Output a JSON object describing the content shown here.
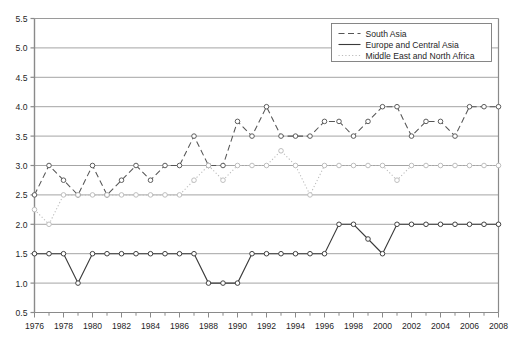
{
  "chart_data": {
    "type": "line",
    "title": "",
    "xlabel": "",
    "ylabel": "",
    "xlim": [
      1976,
      2008
    ],
    "ylim": [
      0.5,
      5.5
    ],
    "grid": true,
    "legend_position": "top-right",
    "xticks": [
      1976,
      1978,
      1980,
      1982,
      1984,
      1986,
      1988,
      1990,
      1992,
      1994,
      1996,
      1998,
      2000,
      2002,
      2004,
      2006,
      2008
    ],
    "xticklabels": [
      "1976",
      "1978",
      "1980",
      "1982",
      "1984",
      "1986",
      "1988",
      "1990",
      "1992",
      "1994",
      "1996",
      "1998",
      "2000",
      "2002",
      "2004",
      "2006",
      "2008"
    ],
    "yticks": [
      0.5,
      1.0,
      1.5,
      2.0,
      2.5,
      3.0,
      3.5,
      4.0,
      4.5,
      5.0,
      5.5
    ],
    "yticklabels": [
      "0.5",
      "1.0",
      "1.5",
      "2.0",
      "2.5",
      "3.0",
      "3.5",
      "4.0",
      "4.5",
      "5.0",
      "5.5"
    ],
    "x": [
      1976,
      1977,
      1978,
      1979,
      1980,
      1981,
      1982,
      1983,
      1984,
      1985,
      1986,
      1987,
      1988,
      1989,
      1990,
      1991,
      1992,
      1993,
      1994,
      1995,
      1996,
      1997,
      1998,
      1999,
      2000,
      2001,
      2002,
      2003,
      2004,
      2005,
      2006,
      2007,
      2008
    ],
    "series": [
      {
        "name": "South Asia",
        "style": "dashed",
        "marker": "circle",
        "color": "#555555",
        "values": [
          2.5,
          3.0,
          2.75,
          2.5,
          3.0,
          2.5,
          2.75,
          3.0,
          2.75,
          3.0,
          3.0,
          3.5,
          3.0,
          3.0,
          3.75,
          3.5,
          4.0,
          3.5,
          3.5,
          3.5,
          3.75,
          3.75,
          3.5,
          3.75,
          4.0,
          4.0,
          3.5,
          3.75,
          3.75,
          3.5,
          4.0,
          4.0,
          4.0
        ]
      },
      {
        "name": "Europe and Central Asia",
        "style": "solid",
        "marker": "circle",
        "color": "#3a3a3a",
        "values": [
          1.5,
          1.5,
          1.5,
          1.0,
          1.5,
          1.5,
          1.5,
          1.5,
          1.5,
          1.5,
          1.5,
          1.5,
          1.0,
          1.0,
          1.0,
          1.5,
          1.5,
          1.5,
          1.5,
          1.5,
          1.5,
          2.0,
          2.0,
          1.75,
          1.5,
          2.0,
          2.0,
          2.0,
          2.0,
          2.0,
          2.0,
          2.0,
          2.0
        ]
      },
      {
        "name": "Middle East and North Africa",
        "style": "dotted",
        "marker": "circle",
        "color": "#bbbbbb",
        "values": [
          2.25,
          2.0,
          2.5,
          2.5,
          2.5,
          2.5,
          2.5,
          2.5,
          2.5,
          2.5,
          2.5,
          2.75,
          3.0,
          2.75,
          3.0,
          3.0,
          3.0,
          3.25,
          3.0,
          2.5,
          3.0,
          3.0,
          3.0,
          3.0,
          3.0,
          2.75,
          3.0,
          3.0,
          3.0,
          3.0,
          3.0,
          3.0,
          3.0
        ]
      }
    ]
  },
  "legend": {
    "items": [
      {
        "label": "South Asia"
      },
      {
        "label": "Europe and Central Asia"
      },
      {
        "label": "Middle East and North Africa"
      }
    ]
  },
  "watermark": {
    "text": ""
  },
  "caption": {
    "text": ""
  }
}
